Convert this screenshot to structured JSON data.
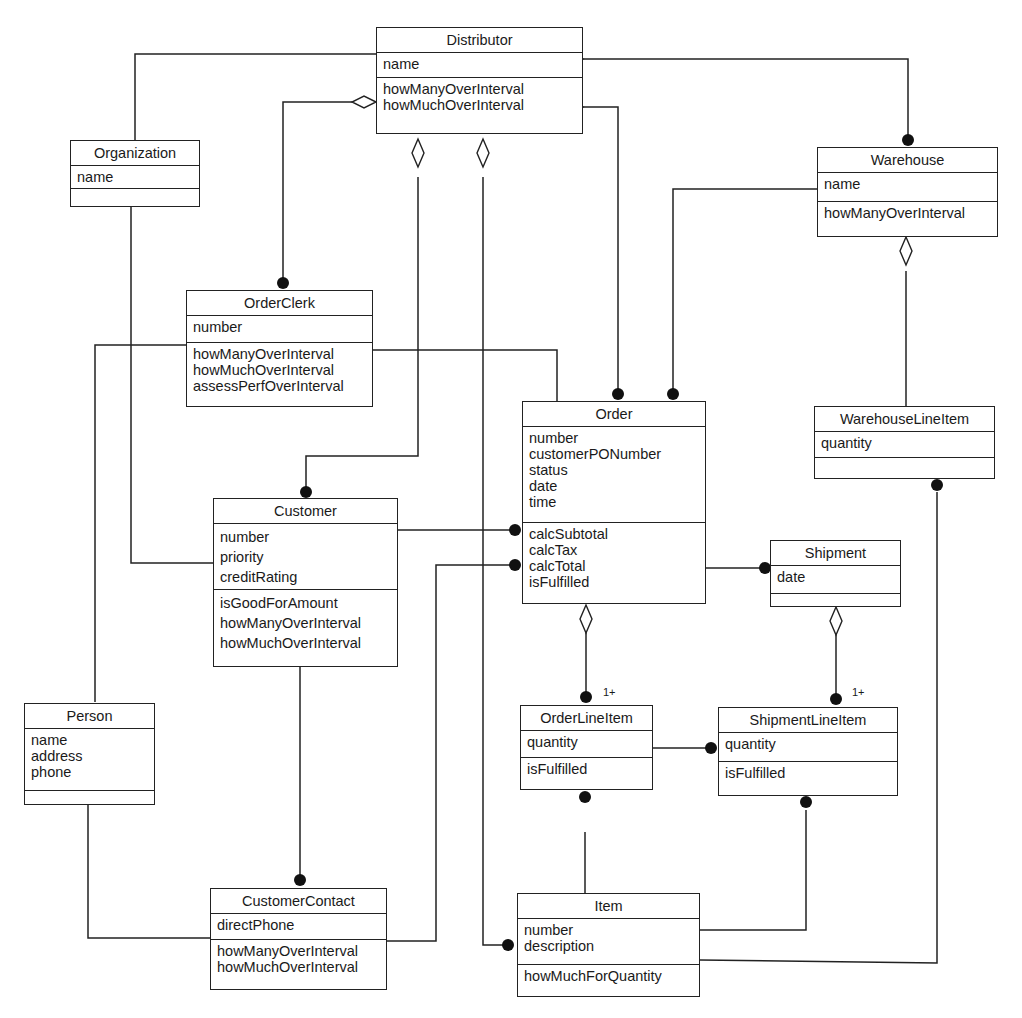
{
  "diagram": {
    "type": "UML class diagram",
    "classes": {
      "distributor": {
        "name": "Distributor",
        "attributes": [
          "name"
        ],
        "operations": [
          "howManyOverInterval",
          "howMuchOverInterval"
        ]
      },
      "organization": {
        "name": "Organization",
        "attributes": [
          "name"
        ],
        "operations": []
      },
      "warehouse": {
        "name": "Warehouse",
        "attributes": [
          "name"
        ],
        "operations": [
          "howManyOverInterval"
        ]
      },
      "orderclerk": {
        "name": "OrderClerk",
        "attributes": [
          "number"
        ],
        "operations": [
          "howManyOverInterval",
          "howMuchOverInterval",
          "assessPerfOverInterval"
        ]
      },
      "order": {
        "name": "Order",
        "attributes": [
          "number",
          "customerPONumber",
          "status",
          "date",
          "time"
        ],
        "operations": [
          "calcSubtotal",
          "calcTax",
          "calcTotal",
          "isFulfilled"
        ]
      },
      "warehouselineitem": {
        "name": "WarehouseLineItem",
        "attributes": [
          "quantity"
        ],
        "operations": []
      },
      "customer": {
        "name": "Customer",
        "attributes": [
          "number",
          "priority",
          "creditRating"
        ],
        "operations": [
          "isGoodForAmount",
          "howManyOverInterval",
          "howMuchOverInterval"
        ]
      },
      "shipment": {
        "name": "Shipment",
        "attributes": [
          "date"
        ],
        "operations": []
      },
      "orderlineitem": {
        "name": "OrderLineItem",
        "attributes": [
          "quantity"
        ],
        "operations": [
          "isFulfilled"
        ]
      },
      "shipmentlineitem": {
        "name": "ShipmentLineItem",
        "attributes": [
          "quantity"
        ],
        "operations": [
          "isFulfilled"
        ]
      },
      "person": {
        "name": "Person",
        "attributes": [
          "name",
          "address",
          "phone"
        ],
        "operations": []
      },
      "customercontact": {
        "name": "CustomerContact",
        "attributes": [
          "directPhone"
        ],
        "operations": [
          "howManyOverInterval",
          "howMuchOverInterval"
        ]
      },
      "item": {
        "name": "Item",
        "attributes": [
          "number",
          "description"
        ],
        "operations": [
          "howMuchForQuantity"
        ]
      }
    },
    "multiplicity_labels": {
      "orderlineitem": "1+",
      "shipmentlineitem": "1+"
    },
    "relationships": [
      {
        "from": "Distributor",
        "to": "Organization",
        "kind": "association"
      },
      {
        "from": "Distributor",
        "to": "Warehouse",
        "kind": "aggregation",
        "end": "many"
      },
      {
        "from": "Distributor",
        "to": "OrderClerk",
        "kind": "aggregation",
        "end": "many"
      },
      {
        "from": "Distributor",
        "to": "Customer",
        "kind": "aggregation",
        "end": "many"
      },
      {
        "from": "Distributor",
        "to": "Item",
        "kind": "aggregation",
        "end": "many"
      },
      {
        "from": "Distributor",
        "to": "Order",
        "kind": "aggregation",
        "end": "many"
      },
      {
        "from": "Warehouse",
        "to": "Order",
        "kind": "association",
        "end": "many"
      },
      {
        "from": "Warehouse",
        "to": "WarehouseLineItem",
        "kind": "aggregation",
        "end": "many"
      },
      {
        "from": "WarehouseLineItem",
        "to": "Item",
        "kind": "association"
      },
      {
        "from": "Organization",
        "to": "Customer",
        "kind": "association"
      },
      {
        "from": "OrderClerk",
        "to": "Person",
        "kind": "association"
      },
      {
        "from": "OrderClerk",
        "to": "Order",
        "kind": "association"
      },
      {
        "from": "Customer",
        "to": "Order",
        "kind": "association",
        "end": "many"
      },
      {
        "from": "Customer",
        "to": "CustomerContact",
        "kind": "association",
        "end": "many"
      },
      {
        "from": "CustomerContact",
        "to": "Order",
        "kind": "association",
        "end": "many"
      },
      {
        "from": "Person",
        "to": "CustomerContact",
        "kind": "association"
      },
      {
        "from": "Order",
        "to": "Shipment",
        "kind": "association",
        "end": "many"
      },
      {
        "from": "Order",
        "to": "OrderLineItem",
        "kind": "aggregation",
        "multiplicity": "1+"
      },
      {
        "from": "Shipment",
        "to": "ShipmentLineItem",
        "kind": "aggregation",
        "multiplicity": "1+"
      },
      {
        "from": "OrderLineItem",
        "to": "ShipmentLineItem",
        "kind": "association",
        "end": "many"
      },
      {
        "from": "OrderLineItem",
        "to": "Item",
        "kind": "association"
      },
      {
        "from": "ShipmentLineItem",
        "to": "Item",
        "kind": "association"
      }
    ]
  }
}
